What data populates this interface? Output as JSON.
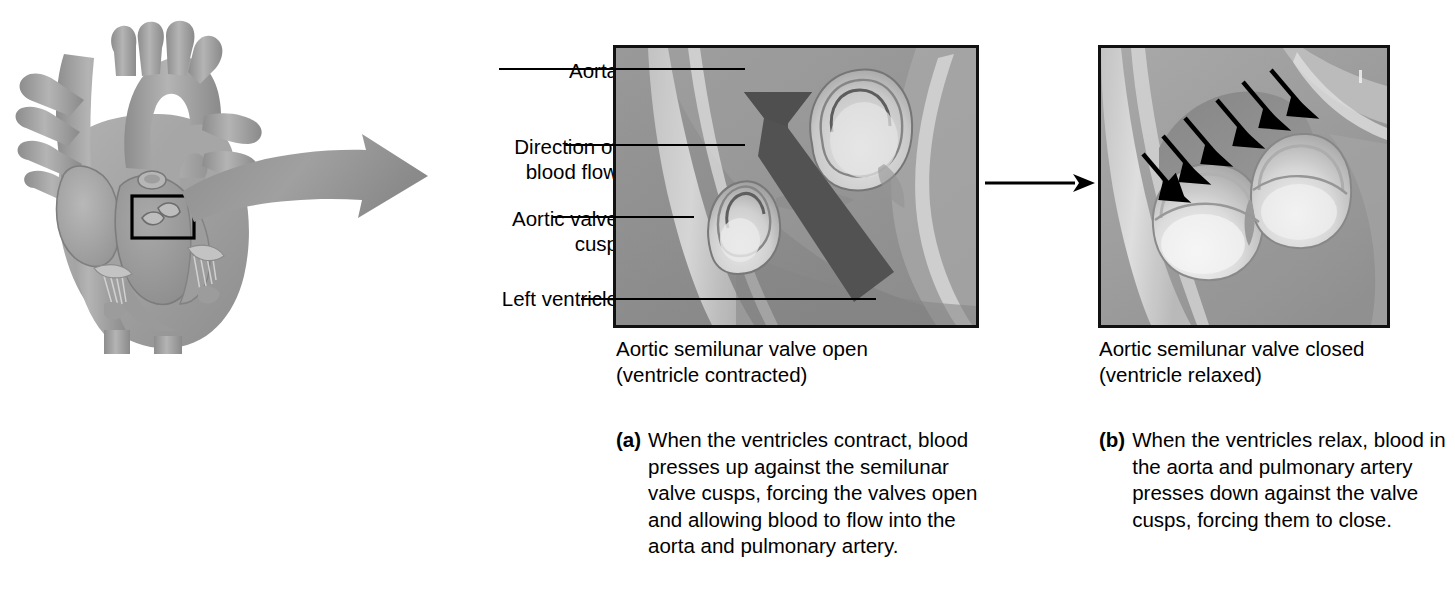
{
  "figure": {
    "background_color": "#ffffff",
    "ink_color": "#000000"
  },
  "heart": {
    "name": "heart-cross-section",
    "description": "Grayscale anatomical cross-section of the human heart with great vessels",
    "highlight_box": {
      "name": "aortic-valve-highlight-box",
      "description": "Black rectangle outlining the aortic valve region that is magnified"
    },
    "fill_color": "#a8a8a8",
    "shade_color": "#8b8b8b",
    "outline_color": "#7a7a7a"
  },
  "magnify_arrow": {
    "name": "magnification-arrow",
    "description": "Large gray curved arrow pointing from the heart highlight to the magnified panel",
    "color": "#9b9b9b"
  },
  "leader_labels": [
    {
      "id": "aorta",
      "lines": [
        "Aorta"
      ]
    },
    {
      "id": "direction-of-blood-flow",
      "lines": [
        "Direction of",
        "blood flow"
      ]
    },
    {
      "id": "aortic-valve-cusp",
      "lines": [
        "Aortic valve",
        "cusp"
      ]
    },
    {
      "id": "left-ventricle",
      "lines": [
        "Left ventricle"
      ]
    }
  ],
  "panels": {
    "a": {
      "id": "panel-a",
      "title_lines": [
        "Aortic semilunar valve open",
        "(ventricle contracted)"
      ],
      "marker": "(a)",
      "body": "When the ventricles contract, blood presses up against the semilunar valve cusps, forcing the valves open and allowing blood to flow into the aorta and pulmonary artery.",
      "illustration": "Aortic valve with cusps pushed open; a single large dark arrow shows blood flowing upward into the aorta",
      "arrow": {
        "name": "blood-flow-arrow",
        "direction": "up-left",
        "count": 1,
        "color": "#555555"
      },
      "tissue_light": "#d9d9d9",
      "tissue_mid": "#a3a3a3",
      "tissue_dark": "#6e6e6e"
    },
    "b": {
      "id": "panel-b",
      "title_lines": [
        "Aortic semilunar valve closed",
        "(ventricle relaxed)"
      ],
      "marker": "(b)",
      "body": "When the ventricles relax, blood in the aorta and pulmonary artery presses down against the valve cusps, forcing them to close.",
      "illustration": "Aortic valve cusps ballooned shut; six small black arrows show blood pressing down onto the cusps",
      "arrow": {
        "name": "backflow-pressure-arrows",
        "direction": "down-right",
        "count": 6,
        "color": "#000000"
      },
      "tissue_light": "#e2e2e2",
      "tissue_mid": "#ababab",
      "tissue_dark": "#767676"
    }
  },
  "connector": {
    "name": "panel-sequence-arrow",
    "description": "Thin black arrow pointing right, linking panel a to panel b",
    "color": "#000000"
  }
}
